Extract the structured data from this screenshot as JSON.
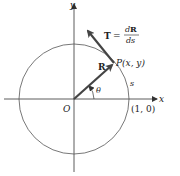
{
  "diagram": {
    "type": "unit-circle-tangent-vector",
    "axes": {
      "x_label": "x",
      "y_label": "y",
      "origin_label": "O"
    },
    "circle": {
      "center": "O",
      "radius": 1
    },
    "point": {
      "label": "P(x, y)"
    },
    "position_vector": {
      "label": "R"
    },
    "tangent_vector": {
      "label_lhs": "T",
      "equals": "=",
      "numerator_d": "d",
      "numerator_R": "R",
      "denominator": "ds"
    },
    "angle": {
      "label": "θ"
    },
    "arc_length": {
      "label": "s"
    },
    "intercept": {
      "label": "(1, 0)"
    },
    "colors": {
      "vector": "#444444",
      "circle": "#555555",
      "axes": "#333333",
      "text": "#222222"
    }
  }
}
